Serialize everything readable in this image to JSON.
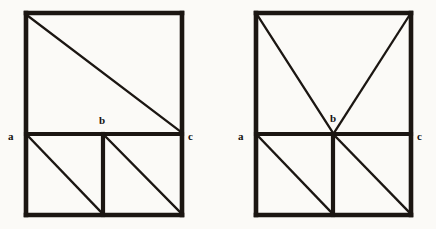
{
  "figure_set": {
    "background_color": "#fbfaf7",
    "stroke_color": "#1b1612",
    "label_color": "#151210",
    "canvas": {
      "width": 436,
      "height": 229
    },
    "figures": [
      {
        "id": "left-figure",
        "name": "left-rectangle-diagram",
        "description": "Rectangle divided by a horizontal line into an upper square region and a lower band; a single long diagonal crosses the upper region from the top-left corner to the right end of the horizontal line; the lower band is split into two cells by a vertical line, each containing a diagonal.",
        "outer_rect": {
          "x1": 26,
          "y1": 13,
          "x2": 182,
          "y2": 215
        },
        "horizontal_divider_y": 134,
        "lower_vertical_divider_x": 103,
        "outer_stroke_width": 4.6,
        "inner_stroke_width": 4.2,
        "diagonal_stroke_width": 2.3,
        "diagonals": [
          {
            "name": "upper-long-diagonal",
            "x1": 28,
            "y1": 16,
            "x2": 181,
            "y2": 132
          },
          {
            "name": "lower-left-cell-diagonal",
            "x1": 29,
            "y1": 137,
            "x2": 101,
            "y2": 212
          },
          {
            "name": "lower-right-cell-diagonal",
            "x1": 106,
            "y1": 137,
            "x2": 180,
            "y2": 212
          }
        ],
        "labels": [
          {
            "name": "vertex-label-a",
            "text": "a",
            "x": 8,
            "y": 131,
            "align": "left"
          },
          {
            "name": "vertex-label-b",
            "text": "b",
            "x": 99,
            "y": 115,
            "align": "left"
          },
          {
            "name": "vertex-label-c",
            "text": "c",
            "x": 188,
            "y": 131,
            "align": "left"
          }
        ]
      },
      {
        "id": "right-figure",
        "name": "right-rectangle-diagram",
        "description": "Rectangle divided by a horizontal line; two diagonals descend from the upper-left and upper-right corners and meet at the midpoint b of the horizontal line; the lower band is split into two cells by a vertical line dropping from b, each cell containing a diagonal.",
        "outer_rect": {
          "x1": 256,
          "y1": 13,
          "x2": 411,
          "y2": 215
        },
        "horizontal_divider_y": 134,
        "lower_vertical_divider_x": 333,
        "outer_stroke_width": 4.6,
        "inner_stroke_width": 4.2,
        "diagonal_stroke_width": 2.3,
        "diagonals": [
          {
            "name": "upper-left-diagonal-to-b",
            "x1": 258,
            "y1": 16,
            "x2": 333,
            "y2": 133
          },
          {
            "name": "upper-right-diagonal-to-b",
            "x1": 409,
            "y1": 16,
            "x2": 334,
            "y2": 133
          },
          {
            "name": "lower-left-cell-diagonal",
            "x1": 259,
            "y1": 137,
            "x2": 331,
            "y2": 212
          },
          {
            "name": "lower-right-cell-diagonal",
            "x1": 336,
            "y1": 137,
            "x2": 409,
            "y2": 212
          }
        ],
        "labels": [
          {
            "name": "vertex-label-a",
            "text": "a",
            "x": 238,
            "y": 131,
            "align": "left"
          },
          {
            "name": "vertex-label-b",
            "text": "b",
            "x": 330,
            "y": 113,
            "align": "left"
          },
          {
            "name": "vertex-label-c",
            "text": "c",
            "x": 417,
            "y": 131,
            "align": "left"
          }
        ]
      }
    ]
  }
}
